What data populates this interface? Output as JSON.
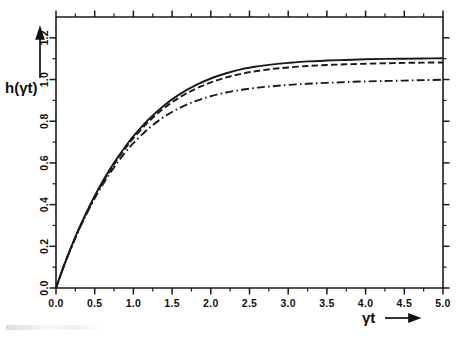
{
  "figure": {
    "background_color": "#ffffff",
    "ink_color": "#1a1a1a",
    "y_axis_title": "h(γt)",
    "x_axis_title": "γt",
    "x_axis_arrow": "→",
    "y_axis_arrow": "↑"
  },
  "chart_data": {
    "type": "line",
    "title": "",
    "subtitle": "",
    "xlabel": "γt",
    "ylabel": "h(γt)",
    "xlim": [
      0.0,
      5.0
    ],
    "ylim": [
      0.0,
      1.3
    ],
    "grid": false,
    "legend": "none",
    "x_ticks": [
      0.0,
      0.5,
      1.0,
      1.5,
      2.0,
      2.5,
      3.0,
      3.5,
      4.0,
      4.5,
      5.0
    ],
    "x_tick_labels": [
      "0.0",
      "0.5",
      "1.0",
      "1.5",
      "2.0",
      "2.5",
      "3.0",
      "3.5",
      "4.0",
      "4.5",
      "5.0"
    ],
    "x_minor_ticks": [
      0.25,
      0.75,
      1.25,
      1.75,
      2.25,
      2.75,
      3.25,
      3.75,
      4.25,
      4.75
    ],
    "y_ticks": [
      0.0,
      0.2,
      0.4,
      0.6,
      0.8,
      1.0,
      1.2
    ],
    "y_tick_labels": [
      "0.0",
      "0.2",
      "0.4",
      "0.6",
      "0.8",
      "1.0",
      "1.2"
    ],
    "y_minor_ticks": [
      0.1,
      0.3,
      0.5,
      0.7,
      0.9,
      1.1
    ],
    "x": [
      0.0,
      0.1,
      0.2,
      0.3,
      0.4,
      0.5,
      0.6,
      0.7,
      0.8,
      0.9,
      1.0,
      1.2,
      1.4,
      1.6,
      1.8,
      2.0,
      2.2,
      2.4,
      2.6,
      2.8,
      3.0,
      3.25,
      3.5,
      3.75,
      4.0,
      4.25,
      4.5,
      4.75,
      5.0
    ],
    "series": [
      {
        "name": "solid",
        "style": "solid",
        "values": [
          0.0,
          0.105,
          0.2,
          0.288,
          0.368,
          0.442,
          0.51,
          0.572,
          0.628,
          0.68,
          0.728,
          0.81,
          0.877,
          0.93,
          0.972,
          1.005,
          1.03,
          1.05,
          1.063,
          1.073,
          1.08,
          1.087,
          1.091,
          1.094,
          1.097,
          1.099,
          1.1,
          1.101,
          1.102
        ]
      },
      {
        "name": "dashed",
        "style": "dashed",
        "values": [
          0.0,
          0.104,
          0.198,
          0.285,
          0.364,
          0.437,
          0.504,
          0.565,
          0.621,
          0.672,
          0.719,
          0.799,
          0.864,
          0.915,
          0.955,
          0.986,
          1.01,
          1.028,
          1.041,
          1.051,
          1.058,
          1.065,
          1.07,
          1.073,
          1.076,
          1.078,
          1.08,
          1.081,
          1.082
        ]
      },
      {
        "name": "dash-dot",
        "style": "dash-dot",
        "values": [
          0.0,
          0.103,
          0.196,
          0.282,
          0.359,
          0.43,
          0.494,
          0.552,
          0.605,
          0.652,
          0.695,
          0.766,
          0.822,
          0.864,
          0.896,
          0.92,
          0.938,
          0.951,
          0.961,
          0.968,
          0.974,
          0.98,
          0.984,
          0.988,
          0.991,
          0.993,
          0.995,
          0.997,
          0.999
        ]
      }
    ]
  }
}
